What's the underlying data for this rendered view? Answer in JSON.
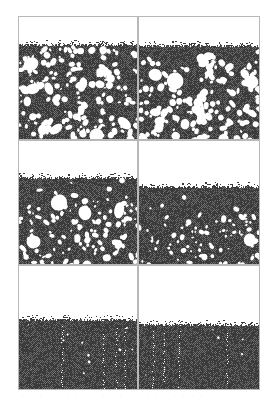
{
  "figure": {
    "layout": {
      "rows": 3,
      "cols": 2
    },
    "colors": {
      "background": "#ffffff",
      "deposit": "#3b3b3b",
      "deposit_light": "#6e6e6e",
      "void": "#ffffff",
      "border": "#b8b8b8"
    },
    "panels": [
      {
        "id": "a",
        "x": 18,
        "y": 16,
        "w": 120,
        "h": 124,
        "surface_y": 28,
        "dense_band": 4,
        "void_density": 0.3,
        "void_size": 3.0,
        "seed": 11
      },
      {
        "id": "b",
        "x": 138,
        "y": 16,
        "w": 122,
        "h": 124,
        "surface_y": 29,
        "dense_band": 10,
        "void_density": 0.28,
        "void_size": 3.4,
        "seed": 23
      },
      {
        "id": "c",
        "x": 18,
        "y": 140,
        "w": 120,
        "h": 125,
        "surface_y": 37,
        "dense_band": 22,
        "void_density": 0.26,
        "void_size": 2.6,
        "seed": 37
      },
      {
        "id": "d",
        "x": 138,
        "y": 140,
        "w": 122,
        "h": 125,
        "surface_y": 46,
        "dense_band": 28,
        "void_density": 0.22,
        "void_size": 2.4,
        "seed": 41
      },
      {
        "id": "e",
        "x": 18,
        "y": 265,
        "w": 120,
        "h": 125,
        "surface_y": 54,
        "dense_band": 70,
        "void_density": 0.1,
        "void_size": 1.3,
        "seed": 53
      },
      {
        "id": "f",
        "x": 138,
        "y": 265,
        "w": 122,
        "h": 125,
        "surface_y": 59,
        "dense_band": 70,
        "void_density": 0.08,
        "void_size": 1.2,
        "seed": 67
      }
    ],
    "caption": "· · · · · · · · · · · · · · · · · · · · · ·"
  }
}
